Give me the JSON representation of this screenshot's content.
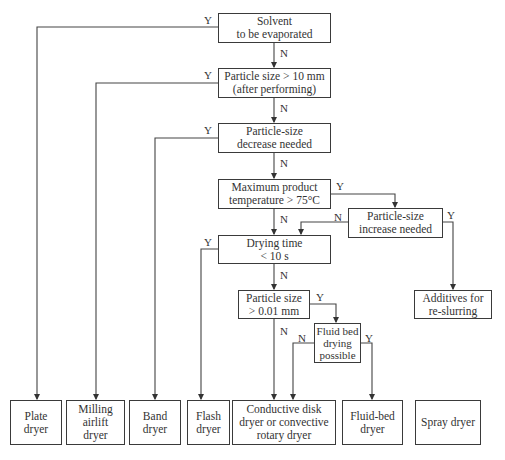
{
  "decisions": {
    "solvent": "Solvent\nto be evaporated",
    "particle_10mm": "Particle size > 10 mm\n(after performing)",
    "decrease": "Particle-size\ndecrease needed",
    "max_temp": "Maximum product\ntemperature > 75°C",
    "increase": "Particle-size\nincrease needed",
    "drying_time": "Drying time\n< 10 s",
    "particle_001": "Particle size\n> 0.01 mm",
    "fluid_possible": "Fluid bed\ndrying\npossible"
  },
  "outcomes": {
    "plate": "Plate\ndryer",
    "milling": "Milling\nairlift\ndryer",
    "band": "Band\ndryer",
    "flash": "Flash\ndryer",
    "conductive": "Conductive disk\ndryer or convective\nrotary dryer",
    "fluid_bed": "Fluid-bed\ndryer",
    "spray": "Spray dryer",
    "additives": "Additives for\nre-slurring"
  },
  "labels": {
    "yes": "Y",
    "no": "N"
  }
}
